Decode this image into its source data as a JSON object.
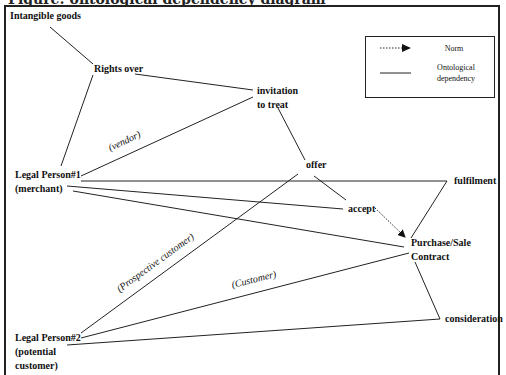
{
  "title": "Figure: ontological dependency diagram",
  "colors": {
    "line": "#222222",
    "text": "#111111",
    "background": "#ffffff"
  },
  "nodes": {
    "intangible_goods": "Intangible goods",
    "rights_over": "Rights over",
    "invitation_line1": "invitation",
    "invitation_line2": "to treat",
    "offer": "offer",
    "legal_person1_line1": "Legal Person#1",
    "legal_person1_line2": "(merchant)",
    "fulfilment": "fulfilment",
    "accept": "accept",
    "purchase_line1": "Purchase/Sale",
    "purchase_line2": "Contract",
    "consideration": "consideration",
    "legal_person2_line1": "Legal Person#2",
    "legal_person2_line2": "(potential",
    "legal_person2_line3": "customer)"
  },
  "roles": {
    "vendor": "(vendor)",
    "prospective_customer": "(Prospective customer)",
    "customer": "(Customer)"
  },
  "legend": {
    "norm_label": "Norm",
    "ontological_line1": "Ontological",
    "ontological_line2": "dependency"
  },
  "edges": [
    {
      "from": "Intangible goods",
      "to": "Rights over",
      "type": "ontological"
    },
    {
      "from": "Rights over",
      "to": "invitation to treat",
      "type": "ontological"
    },
    {
      "from": "Rights over",
      "to": "Legal Person#1",
      "type": "ontological"
    },
    {
      "from": "Legal Person#1",
      "to": "invitation to treat",
      "type": "ontological",
      "label": "(vendor)"
    },
    {
      "from": "invitation to treat",
      "to": "offer",
      "type": "ontological"
    },
    {
      "from": "offer",
      "to": "accept",
      "type": "ontological"
    },
    {
      "from": "Legal Person#1",
      "to": "fulfilment",
      "type": "ontological"
    },
    {
      "from": "Legal Person#1",
      "to": "accept",
      "type": "ontological"
    },
    {
      "from": "Legal Person#1",
      "to": "Purchase/Sale Contract",
      "type": "ontological"
    },
    {
      "from": "accept",
      "to": "Purchase/Sale Contract",
      "type": "norm"
    },
    {
      "from": "fulfilment",
      "to": "Purchase/Sale Contract",
      "type": "ontological"
    },
    {
      "from": "Legal Person#2",
      "to": "offer",
      "type": "ontological",
      "label": "(Prospective customer)"
    },
    {
      "from": "Legal Person#2",
      "to": "Purchase/Sale Contract",
      "type": "ontological",
      "label": "(Customer)"
    },
    {
      "from": "Legal Person#2",
      "to": "consideration",
      "type": "ontological"
    },
    {
      "from": "Purchase/Sale Contract",
      "to": "consideration",
      "type": "ontological"
    }
  ]
}
